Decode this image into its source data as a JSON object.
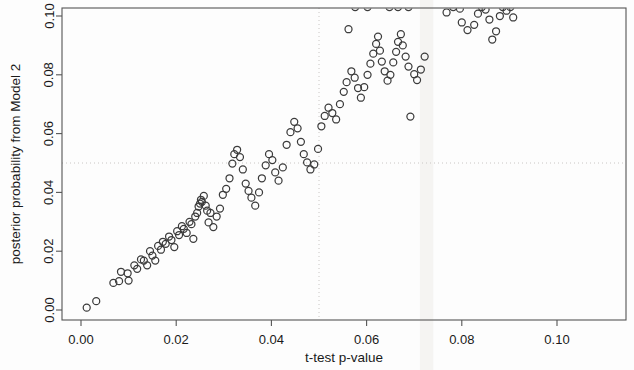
{
  "chart_data": {
    "type": "scatter",
    "title": "",
    "xlabel": "t-test p-value",
    "ylabel": "posterior probability from Model 2",
    "xlim": [
      0.0,
      0.105
    ],
    "ylim": [
      0.0,
      0.103
    ],
    "xticks": [
      0.0,
      0.02,
      0.04,
      0.06,
      0.08,
      0.1
    ],
    "xtick_labels": [
      "0.00",
      "0.02",
      "0.04",
      "0.06",
      "0.08",
      "0.10"
    ],
    "yticks": [
      0.0,
      0.02,
      0.04,
      0.06,
      0.08,
      0.1
    ],
    "ytick_labels": [
      "0.00",
      "0.02",
      "0.04",
      "0.06",
      "0.08",
      "0.10"
    ],
    "grid": false,
    "legend": null,
    "marker": "open-circle",
    "marker_color": "#3c3c3c",
    "reference_lines": [
      {
        "orientation": "vertical",
        "value": 0.05,
        "style": "dotted",
        "color": "#c9c6c4"
      },
      {
        "orientation": "horizontal",
        "value": 0.05,
        "style": "dotted",
        "color": "#c9c6c4"
      }
    ],
    "points": [
      [
        0.0012,
        0.0008
      ],
      [
        0.0032,
        0.003
      ],
      [
        0.0068,
        0.0092
      ],
      [
        0.008,
        0.0098
      ],
      [
        0.0084,
        0.013
      ],
      [
        0.0098,
        0.0125
      ],
      [
        0.01,
        0.01
      ],
      [
        0.0112,
        0.0152
      ],
      [
        0.0118,
        0.014
      ],
      [
        0.0126,
        0.0172
      ],
      [
        0.0132,
        0.0168
      ],
      [
        0.0139,
        0.0152
      ],
      [
        0.0145,
        0.02
      ],
      [
        0.015,
        0.0185
      ],
      [
        0.0156,
        0.0168
      ],
      [
        0.0162,
        0.0218
      ],
      [
        0.0168,
        0.0205
      ],
      [
        0.0172,
        0.0232
      ],
      [
        0.0178,
        0.0225
      ],
      [
        0.0185,
        0.025
      ],
      [
        0.019,
        0.0238
      ],
      [
        0.0196,
        0.0214
      ],
      [
        0.0202,
        0.0268
      ],
      [
        0.0206,
        0.0255
      ],
      [
        0.0212,
        0.0285
      ],
      [
        0.0216,
        0.0276
      ],
      [
        0.0222,
        0.0262
      ],
      [
        0.0228,
        0.03
      ],
      [
        0.0232,
        0.0292
      ],
      [
        0.0236,
        0.0242
      ],
      [
        0.024,
        0.0318
      ],
      [
        0.0244,
        0.033
      ],
      [
        0.0247,
        0.0352
      ],
      [
        0.025,
        0.0362
      ],
      [
        0.0252,
        0.0375
      ],
      [
        0.0254,
        0.0368
      ],
      [
        0.0258,
        0.0388
      ],
      [
        0.0262,
        0.0355
      ],
      [
        0.0265,
        0.0338
      ],
      [
        0.0268,
        0.0298
      ],
      [
        0.0272,
        0.033
      ],
      [
        0.0278,
        0.0282
      ],
      [
        0.0285,
        0.0318
      ],
      [
        0.0292,
        0.0345
      ],
      [
        0.0298,
        0.0392
      ],
      [
        0.0305,
        0.0412
      ],
      [
        0.0312,
        0.0448
      ],
      [
        0.0318,
        0.0498
      ],
      [
        0.0322,
        0.053
      ],
      [
        0.0328,
        0.0545
      ],
      [
        0.0334,
        0.052
      ],
      [
        0.034,
        0.0478
      ],
      [
        0.0346,
        0.043
      ],
      [
        0.0352,
        0.0405
      ],
      [
        0.0358,
        0.0382
      ],
      [
        0.0366,
        0.0355
      ],
      [
        0.0374,
        0.04
      ],
      [
        0.038,
        0.0448
      ],
      [
        0.0388,
        0.0492
      ],
      [
        0.0395,
        0.053
      ],
      [
        0.0402,
        0.051
      ],
      [
        0.0408,
        0.0468
      ],
      [
        0.0415,
        0.044
      ],
      [
        0.0424,
        0.0485
      ],
      [
        0.0432,
        0.0562
      ],
      [
        0.044,
        0.0605
      ],
      [
        0.0448,
        0.064
      ],
      [
        0.0455,
        0.0618
      ],
      [
        0.0462,
        0.0572
      ],
      [
        0.0468,
        0.053
      ],
      [
        0.0475,
        0.0502
      ],
      [
        0.0482,
        0.0478
      ],
      [
        0.049,
        0.0495
      ],
      [
        0.0498,
        0.0548
      ],
      [
        0.0505,
        0.0625
      ],
      [
        0.0512,
        0.066
      ],
      [
        0.052,
        0.0688
      ],
      [
        0.0528,
        0.067
      ],
      [
        0.0536,
        0.0648
      ],
      [
        0.0544,
        0.07
      ],
      [
        0.0552,
        0.0742
      ],
      [
        0.0558,
        0.0775
      ],
      [
        0.0562,
        0.0955
      ],
      [
        0.0568,
        0.0812
      ],
      [
        0.0575,
        0.079
      ],
      [
        0.0582,
        0.0755
      ],
      [
        0.0588,
        0.0722
      ],
      [
        0.0595,
        0.0758
      ],
      [
        0.0602,
        0.08
      ],
      [
        0.0608,
        0.0838
      ],
      [
        0.0614,
        0.0872
      ],
      [
        0.062,
        0.0905
      ],
      [
        0.0624,
        0.093
      ],
      [
        0.0628,
        0.0882
      ],
      [
        0.0632,
        0.0845
      ],
      [
        0.0638,
        0.0812
      ],
      [
        0.0644,
        0.078
      ],
      [
        0.065,
        0.08
      ],
      [
        0.0656,
        0.0842
      ],
      [
        0.0662,
        0.0878
      ],
      [
        0.0666,
        0.0912
      ],
      [
        0.0672,
        0.0938
      ],
      [
        0.0676,
        0.09
      ],
      [
        0.0682,
        0.0862
      ],
      [
        0.0688,
        0.0828
      ],
      [
        0.0692,
        0.0658
      ],
      [
        0.07,
        0.0802
      ],
      [
        0.0706,
        0.0782
      ],
      [
        0.0714,
        0.0818
      ],
      [
        0.0722,
        0.0862
      ],
      [
        0.0576,
        0.103
      ],
      [
        0.0602,
        0.103
      ],
      [
        0.0648,
        0.103
      ],
      [
        0.0666,
        0.103
      ],
      [
        0.0688,
        0.103
      ],
      [
        0.0768,
        0.1012
      ],
      [
        0.0782,
        0.103
      ],
      [
        0.0796,
        0.1025
      ],
      [
        0.08,
        0.0978
      ],
      [
        0.0812,
        0.0952
      ],
      [
        0.0826,
        0.097
      ],
      [
        0.0834,
        0.1008
      ],
      [
        0.0842,
        0.103
      ],
      [
        0.085,
        0.1022
      ],
      [
        0.0858,
        0.0988
      ],
      [
        0.0864,
        0.092
      ],
      [
        0.0872,
        0.0948
      ],
      [
        0.088,
        0.1
      ],
      [
        0.0886,
        0.103
      ],
      [
        0.0894,
        0.1018
      ],
      [
        0.0902,
        0.103
      ],
      [
        0.0908,
        0.0995
      ]
    ]
  },
  "scan_artifact": {
    "x_start": 0.0712,
    "x_end": 0.074
  }
}
